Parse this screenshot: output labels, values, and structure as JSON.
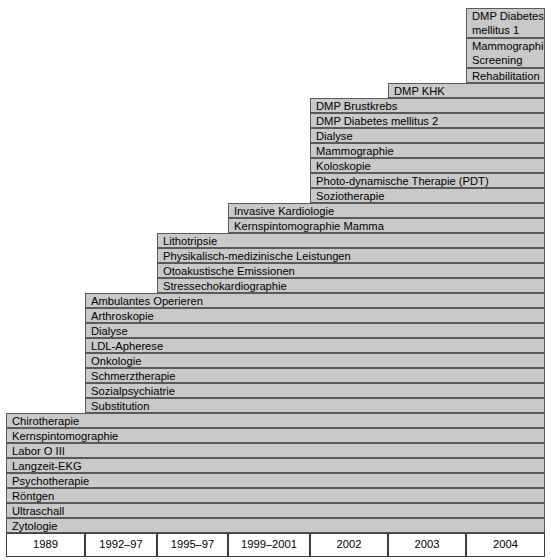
{
  "figure": {
    "kind": "stair-step-timeline",
    "fill_color": "#c9c9c9",
    "border_color": "#5a5a5a",
    "axis_border_color": "#3d3d3d",
    "background_color": "#ffffff"
  },
  "axis": {
    "labels": [
      "1989",
      "1992–97",
      "1995–97",
      "1999–2001",
      "2002",
      "2003",
      "2004"
    ]
  },
  "chart_data": {
    "type": "table",
    "title": "",
    "xlabel": "",
    "ylabel": "",
    "categories": [
      "1989",
      "1992–97",
      "1995–97",
      "1999–2001",
      "2002",
      "2003",
      "2004"
    ],
    "values": [
      8,
      8,
      4,
      2,
      7,
      1,
      3
    ],
    "series": [
      {
        "name": "1989",
        "items": [
          "Chirotherapie",
          "Kernspintomographie",
          "Labor O III",
          "Langzeit-EKG",
          "Psychotherapie",
          "Röntgen",
          "Ultraschall",
          "Zytologie"
        ]
      },
      {
        "name": "1992–97",
        "items": [
          "Ambulantes Operieren",
          "Arthroskopie",
          "Dialyse",
          "LDL-Apherese",
          "Onkologie",
          "Schmerztherapie",
          "Sozialpsychiatrie",
          "Substitution"
        ]
      },
      {
        "name": "1995–97",
        "items": [
          "Lithotripsie",
          "Physikalisch-medizinische Leistungen",
          "Otoakustische Emissionen",
          "Stressechokardiographie"
        ]
      },
      {
        "name": "1999–2001",
        "items": [
          "Invasive Kardiologie",
          "Kernspintomographie Mamma"
        ]
      },
      {
        "name": "2002",
        "items": [
          "DMP Brustkrebs",
          "DMP Diabetes mellitus 2",
          "Dialyse",
          "Mammographie",
          "Koloskopie",
          "Photo-dynamische Therapie (PDT)",
          "Soziotherapie"
        ]
      },
      {
        "name": "2003",
        "items": [
          "DMP KHK"
        ]
      },
      {
        "name": "2004",
        "items": [
          "DMP Diabetes mellitus 1",
          "Mammographie-Screening",
          "Rehabilitation"
        ]
      }
    ]
  },
  "cells": [
    {
      "id": "c2004-0",
      "label": "DMP Diabetes\nmellitus 1",
      "x": 466,
      "y": 8,
      "w": 79,
      "h": 30,
      "lines": 2
    },
    {
      "id": "c2004-1",
      "label": "Mammographie-\nScreening",
      "x": 466,
      "y": 38,
      "w": 79,
      "h": 30,
      "lines": 2
    },
    {
      "id": "c2004-2",
      "label": "Rehabilitation",
      "x": 466,
      "y": 68,
      "w": 79,
      "h": 15,
      "lines": 1
    },
    {
      "id": "c2003-0",
      "label": "DMP KHK",
      "x": 388,
      "y": 83,
      "w": 157,
      "h": 15,
      "lines": 1
    },
    {
      "id": "c2002-0",
      "label": "DMP Brustkrebs",
      "x": 310,
      "y": 98,
      "w": 235,
      "h": 15,
      "lines": 1
    },
    {
      "id": "c2002-1",
      "label": "DMP Diabetes mellitus 2",
      "x": 310,
      "y": 113,
      "w": 235,
      "h": 15,
      "lines": 1
    },
    {
      "id": "c2002-2",
      "label": "Dialyse",
      "x": 310,
      "y": 128,
      "w": 235,
      "h": 15,
      "lines": 1
    },
    {
      "id": "c2002-3",
      "label": "Mammographie",
      "x": 310,
      "y": 143,
      "w": 235,
      "h": 15,
      "lines": 1
    },
    {
      "id": "c2002-4",
      "label": "Koloskopie",
      "x": 310,
      "y": 158,
      "w": 235,
      "h": 15,
      "lines": 1
    },
    {
      "id": "c2002-5",
      "label": "Photo-dynamische Therapie (PDT)",
      "x": 310,
      "y": 173,
      "w": 235,
      "h": 15,
      "lines": 1
    },
    {
      "id": "c2002-6",
      "label": "Soziotherapie",
      "x": 310,
      "y": 188,
      "w": 235,
      "h": 15,
      "lines": 1
    },
    {
      "id": "c1999-0",
      "label": "Invasive Kardiologie",
      "x": 228,
      "y": 203,
      "w": 317,
      "h": 15,
      "lines": 1
    },
    {
      "id": "c1999-1",
      "label": "Kernspintomographie Mamma",
      "x": 228,
      "y": 218,
      "w": 317,
      "h": 15,
      "lines": 1
    },
    {
      "id": "c1995-0",
      "label": "Lithotripsie",
      "x": 157,
      "y": 233,
      "w": 388,
      "h": 15,
      "lines": 1
    },
    {
      "id": "c1995-1",
      "label": "Physikalisch-medizinische Leistungen",
      "x": 157,
      "y": 248,
      "w": 388,
      "h": 15,
      "lines": 1
    },
    {
      "id": "c1995-2",
      "label": "Otoakustische Emissionen",
      "x": 157,
      "y": 263,
      "w": 388,
      "h": 15,
      "lines": 1
    },
    {
      "id": "c1995-3",
      "label": "Stressechokardiographie",
      "x": 157,
      "y": 278,
      "w": 388,
      "h": 15,
      "lines": 1
    },
    {
      "id": "c1992-0",
      "label": "Ambulantes Operieren",
      "x": 85,
      "y": 293,
      "w": 460,
      "h": 15,
      "lines": 1
    },
    {
      "id": "c1992-1",
      "label": "Arthroskopie",
      "x": 85,
      "y": 308,
      "w": 460,
      "h": 15,
      "lines": 1
    },
    {
      "id": "c1992-2",
      "label": "Dialyse",
      "x": 85,
      "y": 323,
      "w": 460,
      "h": 15,
      "lines": 1
    },
    {
      "id": "c1992-3",
      "label": "LDL-Apherese",
      "x": 85,
      "y": 338,
      "w": 460,
      "h": 15,
      "lines": 1
    },
    {
      "id": "c1992-4",
      "label": "Onkologie",
      "x": 85,
      "y": 353,
      "w": 460,
      "h": 15,
      "lines": 1
    },
    {
      "id": "c1992-5",
      "label": "Schmerztherapie",
      "x": 85,
      "y": 368,
      "w": 460,
      "h": 15,
      "lines": 1
    },
    {
      "id": "c1992-6",
      "label": "Sozialpsychiatrie",
      "x": 85,
      "y": 383,
      "w": 460,
      "h": 15,
      "lines": 1
    },
    {
      "id": "c1992-7",
      "label": "Substitution",
      "x": 85,
      "y": 398,
      "w": 460,
      "h": 15,
      "lines": 1
    },
    {
      "id": "c1989-0",
      "label": "Chirotherapie",
      "x": 6,
      "y": 413,
      "w": 539,
      "h": 15,
      "lines": 1
    },
    {
      "id": "c1989-1",
      "label": "Kernspintomographie",
      "x": 6,
      "y": 428,
      "w": 539,
      "h": 15,
      "lines": 1
    },
    {
      "id": "c1989-2",
      "label": "Labor O III",
      "x": 6,
      "y": 443,
      "w": 539,
      "h": 15,
      "lines": 1
    },
    {
      "id": "c1989-3",
      "label": "Langzeit-EKG",
      "x": 6,
      "y": 458,
      "w": 539,
      "h": 15,
      "lines": 1
    },
    {
      "id": "c1989-4",
      "label": "Psychotherapie",
      "x": 6,
      "y": 473,
      "w": 539,
      "h": 15,
      "lines": 1
    },
    {
      "id": "c1989-5",
      "label": "Röntgen",
      "x": 6,
      "y": 488,
      "w": 539,
      "h": 15,
      "lines": 1
    },
    {
      "id": "c1989-6",
      "label": "Ultraschall",
      "x": 6,
      "y": 503,
      "w": 539,
      "h": 15,
      "lines": 1
    },
    {
      "id": "c1989-7",
      "label": "Zytologie",
      "x": 6,
      "y": 518,
      "w": 539,
      "h": 15,
      "lines": 1
    }
  ],
  "axis_cells": [
    {
      "id": "a0",
      "label": "1989",
      "x": 6,
      "y": 533,
      "w": 79
    },
    {
      "id": "a1",
      "label": "1992–97",
      "x": 85,
      "y": 533,
      "w": 72
    },
    {
      "id": "a2",
      "label": "1995–97",
      "x": 157,
      "y": 533,
      "w": 71
    },
    {
      "id": "a3",
      "label": "1999–2001",
      "x": 228,
      "y": 533,
      "w": 82
    },
    {
      "id": "a4",
      "label": "2002",
      "x": 310,
      "y": 533,
      "w": 78
    },
    {
      "id": "a5",
      "label": "2003",
      "x": 388,
      "y": 533,
      "w": 78
    },
    {
      "id": "a6",
      "label": "2004",
      "x": 466,
      "y": 533,
      "w": 79
    }
  ]
}
